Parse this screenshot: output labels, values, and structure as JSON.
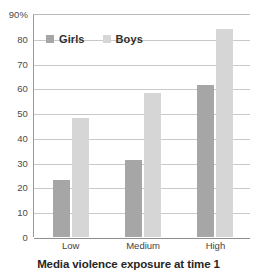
{
  "chart_data": {
    "type": "bar",
    "title": "",
    "xlabel": "Media violence exposure at time 1",
    "ylabel": "",
    "categories": [
      "Low",
      "Medium",
      "High"
    ],
    "series": [
      {
        "name": "Girls",
        "values": [
          23,
          31,
          61.5
        ],
        "color": "#a6a6a6"
      },
      {
        "name": "Boys",
        "values": [
          48,
          58,
          84
        ],
        "color": "#d6d6d6"
      }
    ],
    "ylim": [
      0,
      90
    ],
    "ytick_labels": [
      "90%",
      "80",
      "70",
      "60",
      "50",
      "40",
      "30",
      "20",
      "10",
      "0"
    ],
    "ytick_values": [
      90,
      80,
      70,
      60,
      50,
      40,
      30,
      20,
      10,
      0
    ],
    "grid": true,
    "legend_position": "top-left-inside"
  },
  "axis": {
    "y": {
      "ticks": [
        {
          "label": "90%",
          "value": 90
        },
        {
          "label": "80",
          "value": 80
        },
        {
          "label": "70",
          "value": 70
        },
        {
          "label": "60",
          "value": 60
        },
        {
          "label": "50",
          "value": 50
        },
        {
          "label": "40",
          "value": 40
        },
        {
          "label": "30",
          "value": 30
        },
        {
          "label": "20",
          "value": 20
        },
        {
          "label": "10",
          "value": 10
        },
        {
          "label": "0",
          "value": 0
        }
      ]
    },
    "x": {
      "title": "Media violence exposure at time 1",
      "ticks": [
        {
          "label": "Low"
        },
        {
          "label": "Medium"
        },
        {
          "label": "High"
        }
      ]
    }
  },
  "legend": {
    "items": [
      {
        "label": "Girls",
        "color": "#a6a6a6"
      },
      {
        "label": "Boys",
        "color": "#d6d6d6"
      }
    ]
  }
}
